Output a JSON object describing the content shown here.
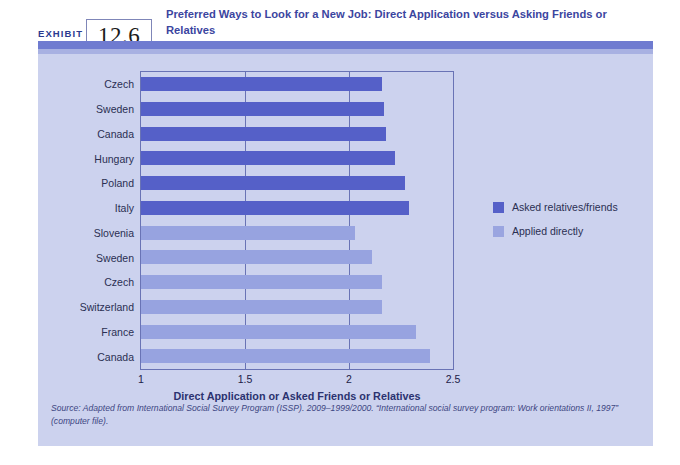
{
  "exhibit": {
    "label": "EXHIBIT",
    "number": "12.6",
    "title": "Preferred Ways to Look for a New Job: Direct Application versus Asking Friends or Relatives"
  },
  "legend": {
    "items": [
      {
        "label": "Asked relatives/friends",
        "color": "#5560c8",
        "series": "asked_relatives_friends"
      },
      {
        "label": "Applied directly",
        "color": "#9aa5e0",
        "series": "applied_directly"
      }
    ]
  },
  "source": {
    "text": "Source: Adapted from International Social Survey Program (ISSP). 2009–1999/2000. “International social survey program: Work orientations II, 1997” (computer file)."
  },
  "chart_data": {
    "type": "bar",
    "orientation": "horizontal",
    "title": "Preferred Ways to Look for a New Job: Direct Application versus Asking Friends or Relatives",
    "xlabel": "Direct Application or Asked Friends or Relatives",
    "ylabel": "",
    "xlim": [
      1,
      2.5
    ],
    "xticks": [
      "1",
      "1.5",
      "2",
      "2.5"
    ],
    "xtick_values": [
      1,
      1.5,
      2,
      2.5
    ],
    "grid": true,
    "legend_position": "right",
    "categories": [
      "Czech",
      "Sweden",
      "Canada",
      "Hungary",
      "Poland",
      "Italy",
      "Slovenia",
      "Sweden",
      "Czech",
      "Switzerland",
      "France",
      "Canada"
    ],
    "bars": [
      {
        "category": "Czech",
        "value": 2.16,
        "series": "Asked relatives/friends",
        "color": "#5560c8"
      },
      {
        "category": "Sweden",
        "value": 2.17,
        "series": "Asked relatives/friends",
        "color": "#5560c8"
      },
      {
        "category": "Canada",
        "value": 2.18,
        "series": "Asked relatives/friends",
        "color": "#5560c8"
      },
      {
        "category": "Hungary",
        "value": 2.22,
        "series": "Asked relatives/friends",
        "color": "#5560c8"
      },
      {
        "category": "Poland",
        "value": 2.27,
        "series": "Asked relatives/friends",
        "color": "#5560c8"
      },
      {
        "category": "Italy",
        "value": 2.29,
        "series": "Asked relatives/friends",
        "color": "#5560c8"
      },
      {
        "category": "Slovenia",
        "value": 2.03,
        "series": "Applied directly",
        "color": "#97a3e0"
      },
      {
        "category": "Sweden",
        "value": 2.11,
        "series": "Applied directly",
        "color": "#97a3e0"
      },
      {
        "category": "Czech",
        "value": 2.16,
        "series": "Applied directly",
        "color": "#97a3e0"
      },
      {
        "category": "Switzerland",
        "value": 2.16,
        "series": "Applied directly",
        "color": "#97a3e0"
      },
      {
        "category": "France",
        "value": 2.32,
        "series": "Applied directly",
        "color": "#97a3e0"
      },
      {
        "category": "Canada",
        "value": 2.39,
        "series": "Applied directly",
        "color": "#97a3e0"
      }
    ]
  }
}
